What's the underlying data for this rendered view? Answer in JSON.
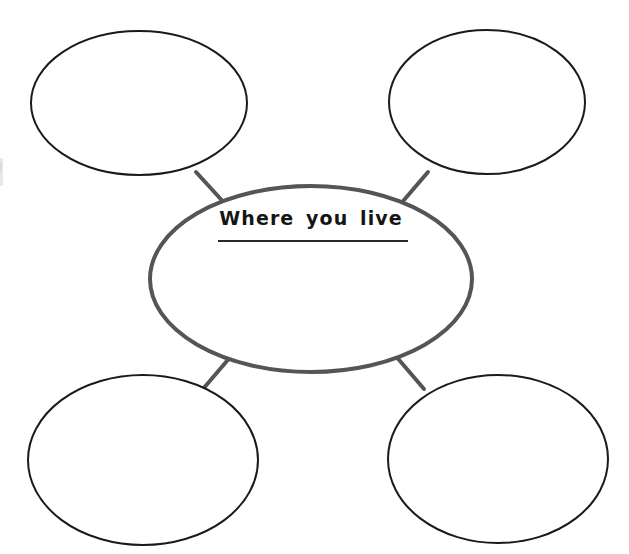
{
  "worksheet": {
    "type": "bubble-map-graphic-organizer",
    "background_color": "#ffffff",
    "width": 629,
    "height": 554,
    "center_node": {
      "label": "Where you live",
      "has_write_on_line": true,
      "stroke_color": "#555555",
      "stroke_width": 4,
      "cx": 311,
      "cy": 279,
      "rx": 161,
      "ry": 93
    },
    "satellite_nodes": [
      {
        "position": "top-left",
        "label": "",
        "stroke_color": "#1a1a1a",
        "stroke_width": 2,
        "cx": 139,
        "cy": 103,
        "rx": 108,
        "ry": 72
      },
      {
        "position": "top-right",
        "label": "",
        "stroke_color": "#1a1a1a",
        "stroke_width": 2,
        "cx": 487,
        "cy": 102,
        "rx": 98,
        "ry": 72
      },
      {
        "position": "bottom-left",
        "label": "",
        "stroke_color": "#1a1a1a",
        "stroke_width": 2,
        "cx": 143,
        "cy": 460,
        "rx": 115,
        "ry": 85
      },
      {
        "position": "bottom-right",
        "label": "",
        "stroke_color": "#1a1a1a",
        "stroke_width": 2,
        "cx": 498,
        "cy": 459,
        "rx": 110,
        "ry": 84
      }
    ],
    "connectors": [
      {
        "from": "center",
        "to": "top-left",
        "stroke_color": "#555555",
        "stroke_width": 4
      },
      {
        "from": "center",
        "to": "top-right",
        "stroke_color": "#555555",
        "stroke_width": 4
      },
      {
        "from": "center",
        "to": "bottom-left",
        "stroke_color": "#555555",
        "stroke_width": 4
      },
      {
        "from": "center",
        "to": "bottom-right",
        "stroke_color": "#555555",
        "stroke_width": 4
      }
    ],
    "write_on_line": {
      "stroke_color": "#2a2a2a",
      "stroke_width": 2,
      "x1": 219,
      "x2": 407,
      "y": 241
    },
    "scan_artifact": {
      "present": true,
      "description": "faint scanner smudge at left edge",
      "color": "#ededed"
    }
  }
}
